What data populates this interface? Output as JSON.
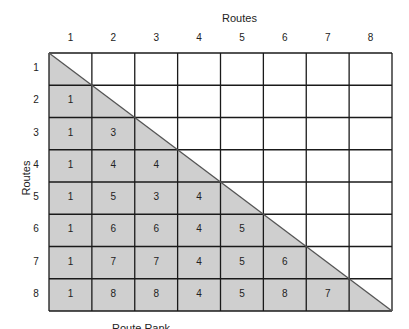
{
  "diagram": {
    "top_axis_title": "Routes",
    "side_axis_title": "Routes",
    "column_labels": [
      "1",
      "2",
      "3",
      "4",
      "5",
      "6",
      "7",
      "8"
    ],
    "row_labels": [
      "1",
      "2",
      "3",
      "4",
      "5",
      "6",
      "7",
      "8"
    ],
    "cells": [
      [],
      [
        "1"
      ],
      [
        "1",
        "3"
      ],
      [
        "1",
        "4",
        "4"
      ],
      [
        "1",
        "5",
        "3",
        "4"
      ],
      [
        "1",
        "6",
        "6",
        "4",
        "5"
      ],
      [
        "1",
        "7",
        "7",
        "4",
        "5",
        "6"
      ],
      [
        "1",
        "8",
        "8",
        "4",
        "5",
        "8",
        "7"
      ]
    ],
    "colors": {
      "shade": "#cfcfcf",
      "grid_line": "#1a1a1a",
      "diagonal": "#555555"
    },
    "footer_text_clipped": "Route Rank"
  }
}
